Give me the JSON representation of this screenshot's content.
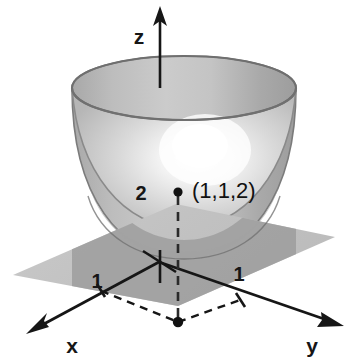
{
  "figure": {
    "background_color": "#ffffff",
    "ink_color": "#161616"
  },
  "axes": {
    "z": {
      "label": "z",
      "arrow": "up",
      "color": "#161616"
    },
    "x": {
      "label": "x",
      "arrow": "down-left",
      "color": "#161616"
    },
    "y": {
      "label": "y",
      "arrow": "down-right",
      "color": "#161616"
    }
  },
  "ticks": {
    "z_two": "2",
    "x_one": "1",
    "y_one": "1"
  },
  "points": [
    {
      "name": "point-on-surface",
      "label": "(1,1,2)",
      "coords": "(1,1,2)"
    },
    {
      "name": "point-on-ground",
      "label": "",
      "coords": "(1,1,0)"
    }
  ],
  "surfaces": {
    "paraboloid": {
      "name": "paraboloid",
      "outer_fill": "#b3b3b3",
      "inner_fill": "#d5d5d5",
      "rim_fill": "#e4e4e4",
      "edge_color": "#767676",
      "highlight_color": "#ffffff"
    },
    "plane": {
      "name": "horizontal-plane",
      "fill": "#c2c2c2",
      "fill_inside_bowl": "#a3a3a3"
    }
  },
  "guides": {
    "dashed_z_axis": "dashed",
    "dashed_vertical_drop": "dashed",
    "dashed_ground_rectangle": "dashed"
  }
}
